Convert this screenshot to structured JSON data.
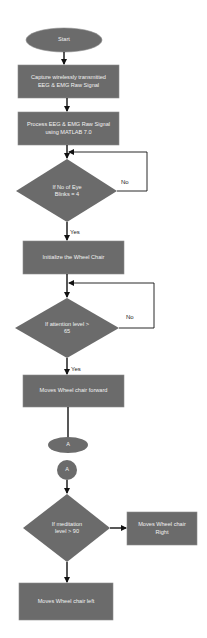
{
  "diagram": {
    "type": "flowchart",
    "colors": {
      "shape_fill": "#6b6b6b",
      "shape_stroke": "#8a8a8a",
      "text": "#f2f2f2",
      "arrow": "#111111",
      "label": "#222222"
    },
    "nodes": {
      "start": "Start",
      "capture": "Capture wirelessly transmitted EEG & EMG Raw Signal",
      "process": "Process EEG & EMG Raw Signal using MATLAB 7.0",
      "decision_blinks": "If No of Eye Blinks = 4",
      "initialize": "Initialize the Wheel Chair",
      "decision_attention": "If attention level > 65",
      "forward": "Moves Wheel chair forward",
      "connector_out": "A",
      "connector_in": "A",
      "decision_meditation": "If meditation level > 90",
      "right": "Moves Wheel chair Right",
      "left": "Moves Wheel chair left"
    },
    "edge_labels": {
      "blinks_no": "No",
      "blinks_yes": "Yes",
      "attention_no": "No",
      "attention_yes": "Yes"
    }
  }
}
